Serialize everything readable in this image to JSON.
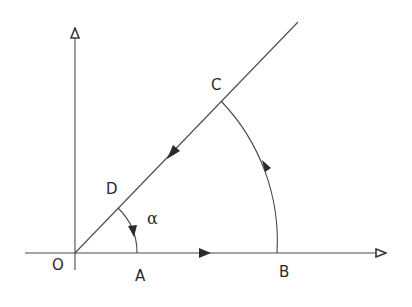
{
  "diagram": {
    "type": "geometry-path-diagram",
    "colors": {
      "stroke": "#4a4a4a",
      "text": "#2b2b2b",
      "background": "#ffffff"
    },
    "points": {
      "O": {
        "label": "O",
        "x": 75,
        "y": 253
      },
      "A": {
        "label": "A",
        "x": 137,
        "y": 253
      },
      "B": {
        "label": "B",
        "x": 277,
        "y": 253
      },
      "C": {
        "label": "C",
        "x": 221,
        "y": 101
      },
      "D": {
        "label": "D",
        "x": 118,
        "y": 208
      }
    },
    "angle_label": "α",
    "axes": {
      "horizontal": {
        "from": [
          25,
          253
        ],
        "to": [
          388,
          253
        ],
        "arrow": "hollow"
      },
      "vertical": {
        "from": [
          75,
          270
        ],
        "to": [
          75,
          27
        ],
        "arrow": "hollow"
      }
    },
    "ray": {
      "from": [
        75,
        253
      ],
      "to": [
        298,
        22
      ]
    },
    "path_segments": [
      {
        "from": "O",
        "to": "B",
        "kind": "line",
        "direction_arrow_at": [
          205,
          253
        ]
      },
      {
        "from": "B",
        "to": "C",
        "kind": "arc",
        "center": "O",
        "direction": "counterclockwise"
      },
      {
        "from": "C",
        "to": "D",
        "kind": "line",
        "direction_arrow_at": [
          172,
          153
        ]
      },
      {
        "from": "D",
        "to": "A",
        "kind": "arc",
        "center": "O",
        "direction": "clockwise"
      }
    ]
  }
}
